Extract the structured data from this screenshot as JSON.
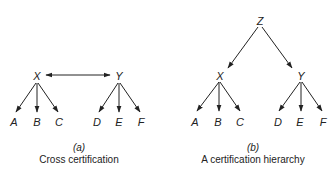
{
  "diagram_a": {
    "nodes": {
      "X": "X",
      "Y": "Y",
      "A": "A",
      "B": "B",
      "C": "C",
      "D": "D",
      "E": "E",
      "F": "F"
    },
    "caption_label": "(a)",
    "caption": "Cross certification",
    "edges": [
      {
        "from": "X",
        "to": "Y",
        "type": "bidirectional"
      },
      {
        "from": "X",
        "to": "A"
      },
      {
        "from": "X",
        "to": "B"
      },
      {
        "from": "X",
        "to": "C"
      },
      {
        "from": "Y",
        "to": "D"
      },
      {
        "from": "Y",
        "to": "E"
      },
      {
        "from": "Y",
        "to": "F"
      }
    ]
  },
  "diagram_b": {
    "nodes": {
      "Z": "Z",
      "X": "X",
      "Y": "Y",
      "A": "A",
      "B": "B",
      "C": "C",
      "D": "D",
      "E": "E",
      "F": "F"
    },
    "caption_label": "(b)",
    "caption": "A certification hierarchy",
    "edges": [
      {
        "from": "Z",
        "to": "X"
      },
      {
        "from": "Z",
        "to": "Y"
      },
      {
        "from": "X",
        "to": "A"
      },
      {
        "from": "X",
        "to": "B"
      },
      {
        "from": "X",
        "to": "C"
      },
      {
        "from": "Y",
        "to": "D"
      },
      {
        "from": "Y",
        "to": "E"
      },
      {
        "from": "Y",
        "to": "F"
      }
    ]
  }
}
